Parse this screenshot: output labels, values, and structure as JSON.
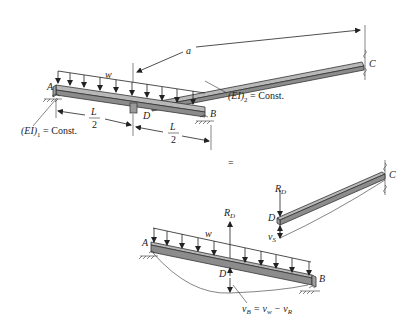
{
  "figure": {
    "top": {
      "labels": {
        "A": "A",
        "B": "B",
        "C": "C",
        "D": "D",
        "w": "w",
        "a": "a",
        "L_num": "L",
        "L_den": "2",
        "EI1_main": "(EI)",
        "EI1_sub": "1",
        "EI1_tail": " = Const.",
        "EI2_main": "(EI)",
        "EI2_sub": "2",
        "EI2_tail": " = Const."
      }
    },
    "equals": "=",
    "bottom_right": {
      "labels": {
        "R": "R",
        "R_sub": "D",
        "D": "D",
        "C": "C",
        "v": "v",
        "v_sub": "S"
      }
    },
    "bottom_left": {
      "labels": {
        "A": "A",
        "B": "B",
        "D": "D",
        "w": "w",
        "R": "R",
        "R_sub": "D",
        "eq_v": "v",
        "eq_vsub": "B",
        "eq_mid": " = v",
        "eq_midsub": "w",
        "eq_minus": " − v",
        "eq_endsub": "R"
      }
    }
  }
}
